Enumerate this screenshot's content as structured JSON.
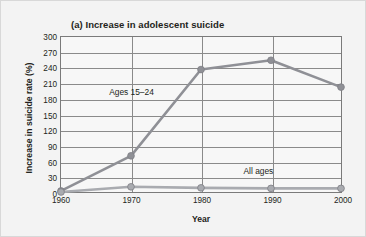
{
  "figure": {
    "panel_label": "(a)",
    "title": "(a) Increase in adolescent suicide",
    "background": "#f3f3f3",
    "border_color": "#d8d8d8",
    "plot_background": "#f7f7f7",
    "grid_color": "#8a8a8a"
  },
  "chart_data": {
    "type": "line",
    "title": "(a) Increase in adolescent suicide",
    "xlabel": "Year",
    "ylabel": "Increase in suicide rate (%)",
    "x": [
      1960,
      1970,
      1980,
      1990,
      2000
    ],
    "xtick_labels": [
      "1960",
      "1970",
      "1980",
      "1990",
      "2000"
    ],
    "xlim": [
      1960,
      2000
    ],
    "ylim": [
      0,
      300
    ],
    "ytick_labels": [
      "0",
      "30",
      "60",
      "90",
      "120",
      "150",
      "180",
      "210",
      "240",
      "270",
      "300"
    ],
    "yticks": [
      0,
      30,
      60,
      90,
      120,
      150,
      180,
      210,
      240,
      270,
      300
    ],
    "grid": true,
    "legend_position": "inline-annotation",
    "series": [
      {
        "name": "Ages 15-24",
        "label": "Ages 15–24",
        "color": "#8f9096",
        "marker": "circle",
        "values": [
          2,
          70,
          237,
          255,
          203
        ],
        "annotation_x": 1970,
        "annotation_y": 195
      },
      {
        "name": "All ages",
        "label": "All ages",
        "color": "#a9abb0",
        "marker": "circle",
        "values": [
          0,
          10,
          8,
          7,
          7
        ],
        "annotation_x": 1988,
        "annotation_y": 43
      }
    ]
  }
}
